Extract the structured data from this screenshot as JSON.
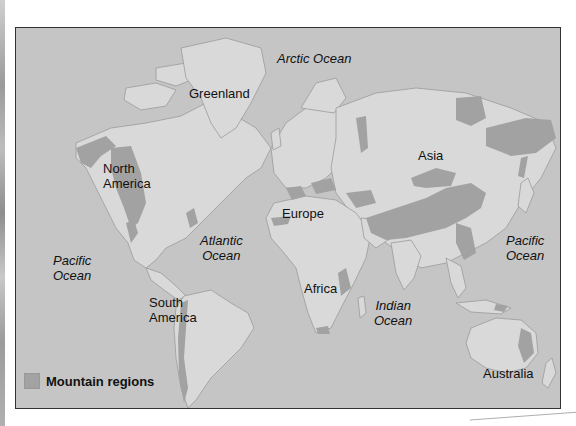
{
  "map": {
    "title": "World mountain regions",
    "colors": {
      "ocean": "#c5c5c5",
      "land": "#d9d9d9",
      "mountain": "#a2a2a2",
      "coast": "#9a9a9a",
      "frame": "#333333"
    },
    "continent_labels": [
      {
        "id": "greenland",
        "text": "Greenland"
      },
      {
        "id": "north-america",
        "text": "North America",
        "lines": [
          "North",
          "America"
        ]
      },
      {
        "id": "europe",
        "text": "Europe"
      },
      {
        "id": "asia",
        "text": "Asia"
      },
      {
        "id": "africa",
        "text": "Africa"
      },
      {
        "id": "south-america",
        "text": "South America",
        "lines": [
          "South",
          "America"
        ]
      },
      {
        "id": "australia",
        "text": "Australia"
      }
    ],
    "ocean_labels": [
      {
        "id": "arctic",
        "text": "Arctic Ocean"
      },
      {
        "id": "atlantic",
        "text": "Atlantic Ocean",
        "lines": [
          "Atlantic",
          "Ocean"
        ]
      },
      {
        "id": "pacific-west",
        "text": "Pacific Ocean",
        "lines": [
          "Pacific",
          "Ocean"
        ]
      },
      {
        "id": "pacific-east",
        "text": "Pacific Ocean",
        "lines": [
          "Pacific",
          "Ocean"
        ]
      },
      {
        "id": "indian",
        "text": "Indian Ocean",
        "lines": [
          "Indian",
          "Ocean"
        ]
      }
    ],
    "legend": {
      "label": "Mountain regions",
      "swatch_color": "#a2a2a2"
    }
  }
}
